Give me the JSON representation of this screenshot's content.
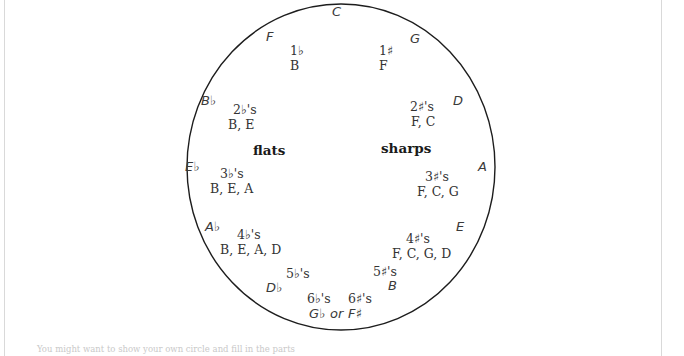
{
  "diagram": {
    "circle_color": "#1d1d1d",
    "text_color": "#333333",
    "background": "#ffffff",
    "side_labels": {
      "flats": "flats",
      "sharps": "sharps"
    },
    "keys": [
      {
        "name": "C",
        "count": "",
        "letters": ""
      },
      {
        "name": "F",
        "count": "1♭",
        "letters": "B"
      },
      {
        "name": "B♭",
        "count": "2♭'s",
        "letters": "B, E"
      },
      {
        "name": "E♭",
        "count": "3♭'s",
        "letters": "B, E, A"
      },
      {
        "name": "A♭",
        "count": "4♭'s",
        "letters": "B, E, A, D"
      },
      {
        "name": "D♭",
        "count": "5♭'s",
        "letters": ""
      },
      {
        "name": "G♭ or F♯",
        "count": "6♭'s",
        "letters": ""
      },
      {
        "name": "G",
        "count": "1♯",
        "letters": "F"
      },
      {
        "name": "D",
        "count": "2♯'s",
        "letters": "F, C"
      },
      {
        "name": "A",
        "count": "3♯'s",
        "letters": "F, C, G"
      },
      {
        "name": "E",
        "count": "4♯'s",
        "letters": "F, C, G, D"
      },
      {
        "name": "B",
        "count": "5♯'s",
        "letters": ""
      },
      {
        "name": "",
        "count": "6♯'s",
        "letters": ""
      }
    ],
    "bottom_text": "You might want to show your own circle and fill in the parts"
  }
}
